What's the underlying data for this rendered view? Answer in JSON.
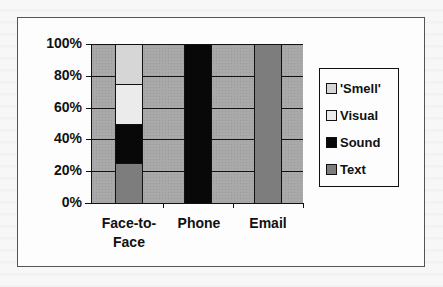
{
  "chart_data": {
    "type": "bar",
    "stacked": true,
    "title": "",
    "xlabel": "",
    "ylabel": "",
    "categories": [
      "Face-to-Face",
      "Phone",
      "Email"
    ],
    "series": [
      {
        "name": "Text",
        "values": [
          25,
          0,
          100
        ],
        "color": "#7d7d7d"
      },
      {
        "name": "Sound",
        "values": [
          25,
          100,
          0
        ],
        "color": "#080808"
      },
      {
        "name": "Visual",
        "values": [
          25,
          0,
          0
        ],
        "color": "#ebebeb"
      },
      {
        "name": "'Smell'",
        "values": [
          25,
          0,
          0
        ],
        "color": "#d6d6d6"
      }
    ],
    "ylim": [
      0,
      100
    ],
    "yticks": [
      "0%",
      "20%",
      "40%",
      "60%",
      "80%",
      "100%"
    ],
    "grid": true,
    "legend_position": "right",
    "plot_background": "#a9a9a9"
  },
  "axis": {
    "y_labels": [
      "100%",
      "80%",
      "60%",
      "40%",
      "20%",
      "0%"
    ],
    "x_labels": [
      "Face-to-\nFace",
      "Phone",
      "Email"
    ]
  },
  "legend": {
    "items": [
      {
        "label": "'Smell'",
        "color": "#d6d6d6"
      },
      {
        "label": "Visual",
        "color": "#ebebeb"
      },
      {
        "label": "Sound",
        "color": "#080808"
      },
      {
        "label": "Text",
        "color": "#7d7d7d"
      }
    ]
  }
}
